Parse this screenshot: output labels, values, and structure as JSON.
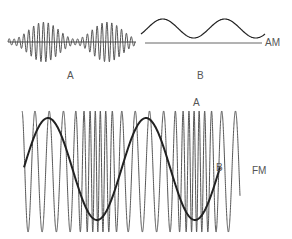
{
  "am_panel": {
    "label_a": "A",
    "label_b": "B",
    "side_label": "AM"
  },
  "fm_panel": {
    "label_a": "A",
    "label_b": "B",
    "side_label": "FM"
  },
  "colors": {
    "carrier": "#555555",
    "modulating": "#222222",
    "background": "#ffffff"
  }
}
